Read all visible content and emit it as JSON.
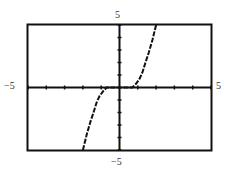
{
  "chart_data": {
    "type": "line",
    "title": "",
    "xlabel": "",
    "ylabel": "",
    "xlim": [
      -5,
      5
    ],
    "ylim": [
      -5,
      5
    ],
    "grid": false,
    "x_tick_step": 1,
    "y_tick_step": 1,
    "window_labels": {
      "xmin": "−5",
      "xmax": "5",
      "ymin": "−5",
      "ymax": "5"
    },
    "series": [
      {
        "name": "curve",
        "x": [
          -2.0,
          -1.8,
          -1.6,
          -1.4,
          -1.25,
          -1.1,
          -0.9,
          -0.7,
          -0.5,
          0.5,
          0.7,
          0.9,
          1.1,
          1.25,
          1.4,
          1.6,
          1.8,
          2.0
        ],
        "y": [
          -5.0,
          -3.8,
          -2.8,
          -1.9,
          -1.2,
          -0.7,
          -0.3,
          0.0,
          0.0,
          0.0,
          0.0,
          0.3,
          0.7,
          1.2,
          1.9,
          2.8,
          3.8,
          5.0
        ]
      }
    ]
  },
  "colors": {
    "frame": "#111111",
    "axis": "#111111",
    "curve": "#111111",
    "label": "#333333"
  }
}
